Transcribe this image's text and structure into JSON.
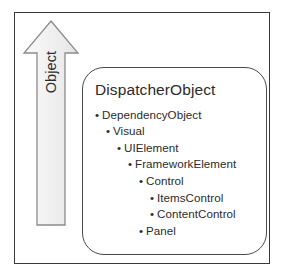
{
  "diagram": {
    "axis": {
      "label": "Object",
      "direction": "up",
      "arrow_icon": "up-arrow-icon"
    },
    "box": {
      "root_class": "DispatcherObject",
      "hierarchy": [
        {
          "label": "DependencyObject",
          "level": 0,
          "bullet": "•"
        },
        {
          "label": "Visual",
          "level": 1,
          "bullet": "•"
        },
        {
          "label": "UIElement",
          "level": 2,
          "bullet": "•"
        },
        {
          "label": "FrameworkElement",
          "level": 3,
          "bullet": "•"
        },
        {
          "label": "Control",
          "level": 4,
          "bullet": "•"
        },
        {
          "label": "ItemsControl",
          "level": 5,
          "bullet": "•"
        },
        {
          "label": "ContentControl",
          "level": 5,
          "bullet": "•"
        },
        {
          "label": "Panel",
          "level": 4,
          "bullet": "•"
        }
      ]
    },
    "colors": {
      "outer_border": "#3a3a3a",
      "inner_border": "#4a4a4a",
      "arrow_fill": "#f2f2f2",
      "arrow_stroke": "#808080",
      "text": "#2b2b2b",
      "background": "#ffffff"
    }
  }
}
